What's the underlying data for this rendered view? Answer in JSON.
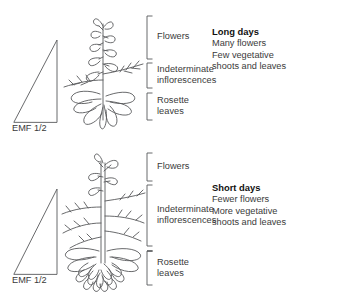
{
  "figure": {
    "background": "#ffffff",
    "line_color": "#58595b",
    "text_color": "#3a3a3a",
    "heading_color": "#111111"
  },
  "panels": [
    {
      "id": "long-days",
      "gradient_label": "EMF 1/2",
      "brackets": [
        {
          "name": "flowers",
          "label": "Flowers"
        },
        {
          "name": "indeterminate-inflorescences",
          "label": "Indeterminate\ninflorescences"
        },
        {
          "name": "rosette-leaves",
          "label": "Rosette\nleaves"
        }
      ],
      "condition": {
        "title": "Long days",
        "lines": [
          "Many flowers",
          "Few vegetative\nshoots and leaves"
        ]
      }
    },
    {
      "id": "short-days",
      "gradient_label": "EMF 1/2",
      "brackets": [
        {
          "name": "flowers",
          "label": "Flowers"
        },
        {
          "name": "indeterminate-inflorescences",
          "label": "Indeterminate\ninflorescences"
        },
        {
          "name": "rosette-leaves",
          "label": "Rosette\nleaves"
        }
      ],
      "condition": {
        "title": "Short days",
        "lines": [
          "Fewer flowers",
          "More vegetative\nshoots and leaves"
        ]
      }
    }
  ]
}
